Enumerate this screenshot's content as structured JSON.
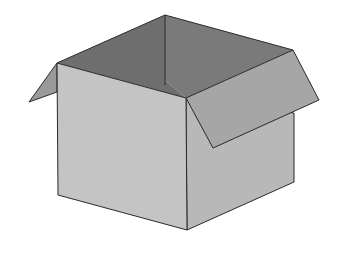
{
  "illustration": {
    "subject": "open-cardboard-box",
    "colors": {
      "background": "#ffffff",
      "interior_back": "#6e6e6e",
      "interior_side": "#7c7c7c",
      "front_face": "#c2c2c2",
      "right_face": "#b6b6b6",
      "left_flap": "#9a9a9a",
      "right_flap": "#a4a4a4",
      "edge": "#2a2a2a"
    }
  }
}
